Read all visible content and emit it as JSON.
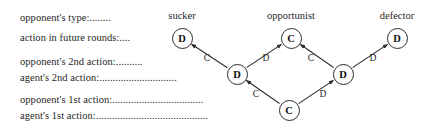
{
  "figure": {
    "kind": "decision-tree",
    "background": "#ffffff",
    "stroke_color": "#2b2b2b",
    "text_color": "#1f1f1f",
    "width": 426,
    "height": 136
  },
  "row_labels": [
    {
      "id": "opponent-type",
      "text": "opponent's type:........",
      "x": 20,
      "y": 12
    },
    {
      "id": "action-future-rounds",
      "text": "action in future rounds:....",
      "x": 20,
      "y": 32
    },
    {
      "id": "opponent-2nd-action",
      "text": "opponent's 2nd action:..........",
      "x": 20,
      "y": 56
    },
    {
      "id": "agent-2nd-action",
      "text": "agent's 2nd action:.............................",
      "x": 20,
      "y": 72
    },
    {
      "id": "opponent-1st-action",
      "text": "opponent's 1st action:..................................",
      "x": 20,
      "y": 94
    },
    {
      "id": "agent-1st-action",
      "text": "agent's 1st action:..........................................",
      "x": 20,
      "y": 110
    }
  ],
  "type_labels": [
    {
      "id": "sucker",
      "text": "sucker",
      "x": 182,
      "y": 10
    },
    {
      "id": "opportunist",
      "text": "opportunist",
      "x": 291,
      "y": 10
    },
    {
      "id": "defector",
      "text": "defector",
      "x": 397,
      "y": 10
    }
  ],
  "nodes": [
    {
      "id": "leaf-sucker",
      "label": "D",
      "x": 182,
      "y": 38
    },
    {
      "id": "leaf-opportunist",
      "label": "C",
      "x": 291,
      "y": 38
    },
    {
      "id": "leaf-defector",
      "label": "D",
      "x": 397,
      "y": 38
    },
    {
      "id": "mid-left",
      "label": "D",
      "x": 237,
      "y": 74
    },
    {
      "id": "mid-right",
      "label": "D",
      "x": 343,
      "y": 74
    },
    {
      "id": "root",
      "label": "C",
      "x": 289,
      "y": 110
    }
  ],
  "edges": [
    {
      "id": "mid-left-to-sucker",
      "from": "mid-left",
      "to": "leaf-sucker",
      "label": "C",
      "label_x": 207,
      "label_y": 58
    },
    {
      "id": "mid-left-to-opportunist",
      "from": "mid-left",
      "to": "leaf-opportunist",
      "label": "D",
      "label_x": 266,
      "label_y": 58
    },
    {
      "id": "mid-right-to-opportunist",
      "from": "mid-right",
      "to": "leaf-opportunist",
      "label": "C",
      "label_x": 311,
      "label_y": 58
    },
    {
      "id": "mid-right-to-defector",
      "from": "mid-right",
      "to": "leaf-defector",
      "label": "D",
      "label_x": 373,
      "label_y": 58
    },
    {
      "id": "root-to-mid-left",
      "from": "root",
      "to": "mid-left",
      "label": "C",
      "label_x": 256,
      "label_y": 94
    },
    {
      "id": "root-to-mid-right",
      "from": "root",
      "to": "mid-right",
      "label": "D",
      "label_x": 323,
      "label_y": 94
    }
  ]
}
